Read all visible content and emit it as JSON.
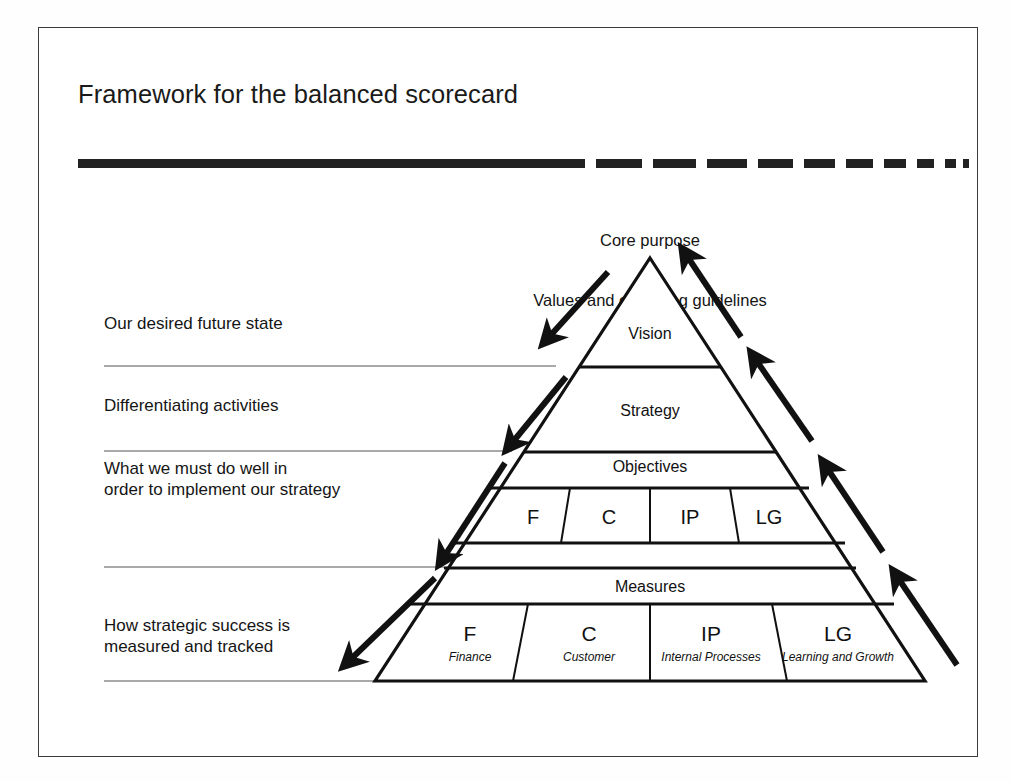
{
  "slide": {
    "title": "Framework for the balanced scorecard",
    "border_color": "#3b3b3b",
    "background": "#ffffff",
    "ink_color": "#111111"
  },
  "divider_rule": {
    "name": "tapered-dashed-rule",
    "solid_end_x": 585,
    "description": "thick solid bar fading into progressively shorter dashes"
  },
  "apex": {
    "line1": "Core purpose",
    "line2": "Values and operating guidelines"
  },
  "side_labels": [
    {
      "text": "Our desired future state",
      "top": 313,
      "left": 104
    },
    {
      "text": "Differentiating activities",
      "top": 395,
      "left": 104
    },
    {
      "text": "What we must do well in\norder to implement our strategy",
      "top": 458,
      "left": 104
    },
    {
      "text": "How strategic success is\nmeasured and tracked",
      "top": 615,
      "left": 104
    }
  ],
  "pyramid": {
    "tiers": [
      {
        "label": "Vision",
        "name": "tier-vision"
      },
      {
        "label": "Strategy",
        "name": "tier-strategy"
      },
      {
        "label": "Objectives",
        "name": "tier-objectives"
      },
      {
        "label": "Measures",
        "name": "tier-measures"
      }
    ],
    "objectives_cells": [
      {
        "code": "F"
      },
      {
        "code": "C"
      },
      {
        "code": "IP"
      },
      {
        "code": "LG"
      }
    ],
    "measures_cells": [
      {
        "code": "F",
        "caption": "Finance"
      },
      {
        "code": "C",
        "caption": "Customer"
      },
      {
        "code": "IP",
        "caption": "Internal Processes"
      },
      {
        "code": "LG",
        "caption": "Learning and Growth"
      }
    ]
  },
  "arrows": {
    "down_count": 4,
    "up_count": 4,
    "down_name": "cascade-down-arrow",
    "up_name": "feedback-up-arrow"
  },
  "chart_data": {
    "type": "diagram",
    "title": "Framework for the balanced scorecard",
    "shape": "pyramid",
    "levels": [
      {
        "name": "Core purpose / Values and operating guidelines",
        "position": "above apex"
      },
      {
        "name": "Vision",
        "meaning": "Our desired future state"
      },
      {
        "name": "Strategy",
        "meaning": "Differentiating activities"
      },
      {
        "name": "Objectives",
        "meaning": "What we must do well in order to implement our strategy",
        "cells": [
          "F",
          "C",
          "IP",
          "LG"
        ]
      },
      {
        "name": "Measures",
        "meaning": "How strategic success is measured and tracked",
        "cells": [
          "F - Finance",
          "C - Customer",
          "IP - Internal Processes",
          "LG - Learning and Growth"
        ]
      }
    ],
    "flows": [
      {
        "direction": "down",
        "side": "left",
        "count": 4,
        "meaning": "cascade from purpose to measures"
      },
      {
        "direction": "up",
        "side": "right",
        "count": 4,
        "meaning": "feedback from measures to purpose"
      }
    ]
  }
}
